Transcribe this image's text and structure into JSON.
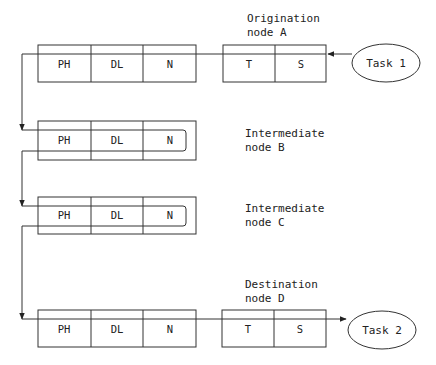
{
  "diagram": {
    "type": "network-message-path",
    "nodes": [
      {
        "id": "A",
        "label_line1": "Origination",
        "label_line2": "node A",
        "layers": [
          "PH",
          "DL",
          "N"
        ],
        "upper_layers": [
          "T",
          "S"
        ],
        "task": "Task 1"
      },
      {
        "id": "B",
        "label_line1": "Intermediate",
        "label_line2": "node B",
        "layers": [
          "PH",
          "DL",
          "N"
        ]
      },
      {
        "id": "C",
        "label_line1": "Intermediate",
        "label_line2": "node C",
        "layers": [
          "PH",
          "DL",
          "N"
        ]
      },
      {
        "id": "D",
        "label_line1": "Destination",
        "label_line2": "node D",
        "layers": [
          "PH",
          "DL",
          "N"
        ],
        "upper_layers": [
          "T",
          "S"
        ],
        "task": "Task 2"
      }
    ],
    "flow": [
      "Task 1",
      "S",
      "T",
      "N",
      "DL",
      "PH",
      "node B",
      "node C",
      "PH",
      "DL",
      "N",
      "T",
      "S",
      "Task 2"
    ],
    "colors": {
      "line": "#333333",
      "text": "#222222",
      "background": "#ffffff"
    }
  }
}
